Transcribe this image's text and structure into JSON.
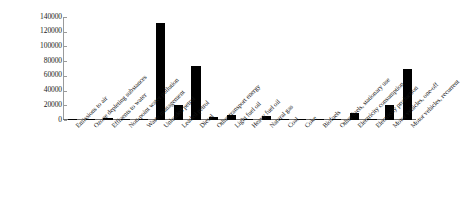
{
  "chart_data": {
    "type": "bar",
    "title": "",
    "subtitle": "",
    "xlabel": "",
    "ylabel": "",
    "grid": false,
    "legend": "none",
    "orientation": "vertical",
    "bar_color": "#000000",
    "axis_color": "#808080",
    "ylim": [
      0,
      140000
    ],
    "ytick_labels": [
      "140000",
      "120000",
      "100000",
      "80000",
      "60000",
      "40000",
      "20000",
      "0"
    ],
    "ytick_values": [
      140000,
      120000,
      100000,
      80000,
      60000,
      40000,
      20000,
      0
    ],
    "ytick_step": 20000,
    "categories": [
      "Emissions to air",
      "Ozone depleting substances",
      "Effluents to water",
      "Non-point water pollution",
      "Waste management",
      "Unleaded petrol",
      "Leaded petrol",
      "Diesel",
      "Other transport energy",
      "Light fuel oil",
      "Heavy fuel oil",
      "Natural gas",
      "Coal",
      "Coke",
      "Biofuels",
      "Other fuels, stationary use",
      "Electricity consumption",
      "Electricity production",
      "Motor vehicles, one-off",
      "Motor vehicles, recurrent"
    ],
    "values": [
      700,
      600,
      2200,
      200,
      2000,
      132000,
      21000,
      73000,
      3500,
      6800,
      800,
      5000,
      900,
      300,
      600,
      400,
      9000,
      700,
      20000,
      70000
    ]
  }
}
